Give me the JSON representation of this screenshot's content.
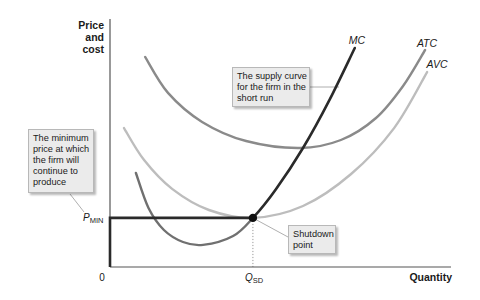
{
  "figure": {
    "y_axis_label": [
      "Price",
      "and",
      "cost"
    ],
    "x_axis_label": "Quantity",
    "origin_label": "0",
    "q_sd": {
      "main": "Q",
      "sub": "SD"
    },
    "p_min": {
      "main": "P",
      "sub": "MIN"
    }
  },
  "curve_labels": {
    "mc": "MC",
    "atc": "ATC",
    "avc": "AVC"
  },
  "callouts": {
    "supply": [
      "The supply curve",
      "for the firm in the",
      "short run"
    ],
    "minimum_price": [
      "The minimum",
      "price at which",
      "the firm will",
      "continue to",
      "produce"
    ],
    "shutdown": [
      "Shutdown",
      "point"
    ]
  },
  "colors": {
    "axis": "#555555",
    "atc": "#8a8a8a",
    "avc": "#bdbdbd",
    "mc_below_shutdown": "#707070",
    "supply": "#2a2a2a",
    "connector": "#9a9a9a",
    "dotted_guide": "#9a9a9a"
  },
  "chart_data": {
    "type": "line",
    "title": "",
    "xlabel": "Quantity",
    "ylabel": "Price and cost",
    "xlim": [
      0,
      100
    ],
    "ylim": [
      0,
      100
    ],
    "grid": false,
    "legend": "inline curve labels",
    "x_ticks": [
      {
        "x": 0,
        "label": "0"
      },
      {
        "x": 41.9,
        "label": "Q_SD"
      }
    ],
    "y_ticks": [
      {
        "y": 19.8,
        "label": "P_MIN"
      }
    ],
    "series": [
      {
        "name": "ATC",
        "points": [
          [
            10.3,
            84.7
          ],
          [
            17.0,
            70.2
          ],
          [
            27.0,
            58.5
          ],
          [
            39.9,
            50.8
          ],
          [
            55.7,
            48.0
          ],
          [
            67.7,
            51.2
          ],
          [
            78.0,
            60.1
          ],
          [
            85.9,
            72.9
          ],
          [
            92.4,
            87.5
          ]
        ]
      },
      {
        "name": "AVC",
        "points": [
          [
            4.1,
            56.0
          ],
          [
            10.0,
            43.1
          ],
          [
            18.2,
            31.5
          ],
          [
            29.0,
            23.0
          ],
          [
            41.9,
            19.8
          ],
          [
            56.6,
            24.6
          ],
          [
            70.7,
            37.5
          ],
          [
            83.3,
            56.0
          ],
          [
            93.0,
            78.6
          ]
        ]
      },
      {
        "name": "MC",
        "points": [
          [
            7.6,
            37.9
          ],
          [
            11.3,
            23.8
          ],
          [
            15.8,
            14.9
          ],
          [
            21.4,
            10.1
          ],
          [
            27.3,
            8.9
          ],
          [
            36.1,
            12.5
          ],
          [
            41.9,
            19.8
          ],
          [
            48.7,
            31.5
          ],
          [
            56.6,
            48.0
          ],
          [
            64.5,
            67.7
          ],
          [
            71.8,
            88.3
          ]
        ]
      }
    ],
    "supply_curve": {
      "description": "The supply curve for the firm in the short run",
      "flat_segments": [
        [
          0,
          0
        ],
        [
          0,
          19.8
        ],
        [
          41.9,
          19.8
        ]
      ],
      "follows_series": "MC",
      "from_point": [
        41.9,
        19.8
      ]
    },
    "annotations": [
      {
        "label": "Shutdown point",
        "x": 41.9,
        "y": 19.8,
        "marker": "dot"
      },
      {
        "label": "The minimum price at which the firm will continue to produce",
        "y": 19.8
      },
      {
        "label": "The supply curve for the firm in the short run"
      }
    ]
  }
}
